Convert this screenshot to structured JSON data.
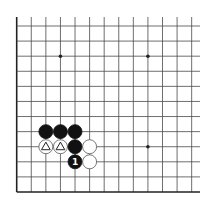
{
  "diagram": {
    "type": "go-board-fragment",
    "corner": "bottom-left",
    "grid": {
      "columns_visible": 13,
      "rows_visible": 12,
      "origin_x": 16.7,
      "origin_y": 26,
      "spacing_x": 14.58,
      "spacing_y": 15.09,
      "right_extent": 200,
      "top_extent": 17
    },
    "star_points": [
      {
        "col": 3,
        "row": 2
      },
      {
        "col": 9,
        "row": 2
      },
      {
        "col": 9,
        "row": 8
      }
    ],
    "stones": [
      {
        "color": "black",
        "col": 2,
        "row": 7,
        "marker": ""
      },
      {
        "color": "black",
        "col": 3,
        "row": 7,
        "marker": ""
      },
      {
        "color": "black",
        "col": 4,
        "row": 7,
        "marker": ""
      },
      {
        "color": "white",
        "col": 2,
        "row": 8,
        "marker": "triangle"
      },
      {
        "color": "white",
        "col": 3,
        "row": 8,
        "marker": "triangle"
      },
      {
        "color": "black",
        "col": 4,
        "row": 8,
        "marker": ""
      },
      {
        "color": "white",
        "col": 5,
        "row": 8,
        "marker": ""
      },
      {
        "color": "black",
        "col": 4,
        "row": 9,
        "marker": "number",
        "label": "1"
      },
      {
        "color": "white",
        "col": 5,
        "row": 9,
        "marker": ""
      }
    ],
    "colors": {
      "black_stone": "#111111",
      "white_stone": "#ffffff",
      "line": "#4a4a4a",
      "background": "#ffffff"
    }
  }
}
